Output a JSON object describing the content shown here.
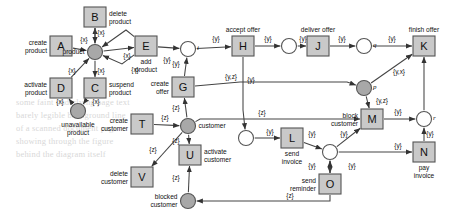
{
  "diagram": {
    "type": "petri-net",
    "title": "",
    "colors": {
      "transition_fill": "#c9c9c9",
      "transition_stroke": "#555555",
      "place_open_fill": "#ffffff",
      "place_shaded_fill": "#a8a8a8",
      "place_stroke": "#555555",
      "edge": "#444444",
      "text": "#111111",
      "ghost_text": "#d8d8d8"
    },
    "transitions": [
      {
        "id": "A",
        "letter": "A",
        "label": "create product",
        "label_pos": "left",
        "x": 61,
        "y": 46
      },
      {
        "id": "B",
        "letter": "B",
        "label": "delete product",
        "label_pos": "right",
        "x": 95,
        "y": 17
      },
      {
        "id": "C",
        "letter": "C",
        "label": "suspend product",
        "label_pos": "right",
        "x": 95,
        "y": 88
      },
      {
        "id": "D",
        "letter": "D",
        "label": "activate product",
        "label_pos": "left",
        "x": 61,
        "y": 88
      },
      {
        "id": "E",
        "letter": "E",
        "label": "add product",
        "label_pos": "below",
        "x": 146,
        "y": 46
      },
      {
        "id": "G",
        "letter": "G",
        "label": "create offer",
        "label_pos": "left",
        "x": 183,
        "y": 87
      },
      {
        "id": "H",
        "letter": "H",
        "label": "accept offer",
        "label_pos": "above",
        "x": 243,
        "y": 46
      },
      {
        "id": "J",
        "letter": "J",
        "label": "deliver offer",
        "label_pos": "above",
        "x": 318,
        "y": 46
      },
      {
        "id": "K",
        "letter": "K",
        "label": "finish offer",
        "label_pos": "above",
        "x": 424,
        "y": 46
      },
      {
        "id": "L",
        "letter": "L",
        "label": "send invoice",
        "label_pos": "below",
        "x": 292,
        "y": 138
      },
      {
        "id": "M",
        "letter": "M",
        "label": "block customer",
        "label_pos": "left",
        "x": 372,
        "y": 119
      },
      {
        "id": "N",
        "letter": "N",
        "label": "pay invoice",
        "label_pos": "below",
        "x": 424,
        "y": 152
      },
      {
        "id": "O",
        "letter": "O",
        "label": "send reminder",
        "label_pos": "left",
        "x": 330,
        "y": 184
      },
      {
        "id": "T",
        "letter": "T",
        "label": "create customer",
        "label_pos": "left",
        "x": 142,
        "y": 124
      },
      {
        "id": "U",
        "letter": "U",
        "label": "activate customer",
        "label_pos": "right",
        "x": 190,
        "y": 155
      },
      {
        "id": "V",
        "letter": "V",
        "label": "delete customer",
        "label_pos": "left",
        "x": 142,
        "y": 177
      }
    ],
    "places": [
      {
        "id": "product",
        "label": "product",
        "label_pos": "left",
        "shaded": true,
        "x": 95,
        "y": 52,
        "tag": ""
      },
      {
        "id": "unavailable",
        "label": "unavailable product",
        "label_pos": "below",
        "shaded": true,
        "x": 78,
        "y": 111,
        "tag": ""
      },
      {
        "id": "i",
        "label": "",
        "label_pos": "",
        "shaded": false,
        "x": 188,
        "y": 49,
        "tag": "i"
      },
      {
        "id": "customer",
        "label": "customer",
        "label_pos": "right",
        "shaded": true,
        "x": 188,
        "y": 126,
        "tag": ""
      },
      {
        "id": "blocked",
        "label": "blocked customer",
        "label_pos": "left",
        "shaded": true,
        "x": 188,
        "y": 201,
        "tag": ""
      },
      {
        "id": "afterH",
        "label": "",
        "label_pos": "",
        "shaded": false,
        "x": 289,
        "y": 46,
        "tag": ""
      },
      {
        "id": "q",
        "label": "",
        "label_pos": "",
        "shaded": false,
        "x": 364,
        "y": 46,
        "tag": "q"
      },
      {
        "id": "p",
        "label": "",
        "label_pos": "",
        "shaded": true,
        "x": 364,
        "y": 88,
        "tag": "p"
      },
      {
        "id": "invoice",
        "label": "",
        "label_pos": "",
        "shaded": false,
        "x": 246,
        "y": 138,
        "tag": ""
      },
      {
        "id": "diamond",
        "label": "",
        "label_pos": "",
        "shaded": false,
        "x": 330,
        "y": 152,
        "tag": ""
      },
      {
        "id": "r",
        "label": "",
        "label_pos": "",
        "shaded": false,
        "x": 424,
        "y": 119,
        "tag": "r"
      }
    ],
    "edge_labels": [
      "{x}",
      "{y}",
      "{z}",
      "{y,z}",
      "{y,x}"
    ]
  },
  "ghost_text": [
    {
      "text": "some faint underlying page text",
      "x": 16,
      "y": 97
    },
    {
      "text": "barely legible background line",
      "x": 16,
      "y": 110
    },
    {
      "text": "of a scanned document page",
      "x": 16,
      "y": 123
    },
    {
      "text": "showing through the figure",
      "x": 16,
      "y": 136
    },
    {
      "text": "behind the diagram itself",
      "x": 16,
      "y": 149
    }
  ]
}
